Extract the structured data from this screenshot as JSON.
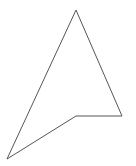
{
  "diagram": {
    "width": 136,
    "height": 166,
    "background": "#ffffff",
    "shape": {
      "type": "polygon",
      "name": "concave-quadrilateral",
      "points": [
        [
          76,
          10
        ],
        [
          122,
          116
        ],
        [
          76,
          116
        ],
        [
          7,
          159
        ]
      ],
      "stroke": "#555555",
      "stroke_width": 1,
      "fill": "none"
    }
  }
}
